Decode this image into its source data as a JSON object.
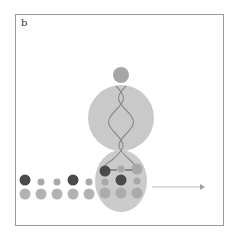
{
  "figure": {
    "panel_label": "b",
    "colors": {
      "frame": "#9a9a9a",
      "body_fill": "#c8c8c8",
      "small_subunit_fill": "#cbcbcb",
      "top_bead": "#a6a6a6",
      "helix_strand": "#8a8a8a",
      "dark_bead": "#4a4a4a",
      "mid_bead": "#a8a8a8",
      "light_bead": "#b4b4b4",
      "arrow": "#b0b0b0"
    },
    "components": [
      "top-bead",
      "upper-ellipse",
      "lower-ellipse",
      "double-helix",
      "bead-chain-top-row",
      "bead-chain-bottom-row",
      "direction-arrow"
    ]
  }
}
